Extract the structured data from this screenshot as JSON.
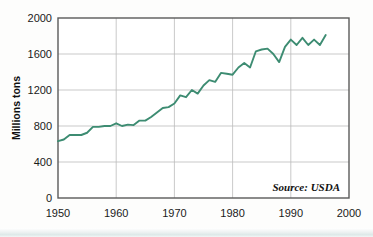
{
  "chart_data": {
    "type": "line",
    "title": "",
    "subtitle": "",
    "xlabel": "",
    "ylabel": "Millions tons",
    "xlim": [
      1950,
      2000
    ],
    "ylim": [
      0,
      2000
    ],
    "grid": true,
    "legend": null,
    "annotations": [
      {
        "name": "source",
        "text": "Source: USDA",
        "position": "bottom-right-inside"
      }
    ],
    "axis": {
      "y_ticks": [
        0,
        400,
        800,
        1200,
        1600,
        2000
      ],
      "y_tick_labels": [
        "0",
        "400",
        "800",
        "1200",
        "1600",
        "2000"
      ],
      "x_ticks": [
        1950,
        1960,
        1970,
        1980,
        1990,
        2000
      ],
      "x_tick_labels": [
        "1950",
        "1960",
        "1970",
        "1980",
        "1990",
        "2000"
      ]
    },
    "series": [
      {
        "name": "World grain production",
        "color": "#3d8c72",
        "x": [
          1950,
          1951,
          1952,
          1953,
          1954,
          1955,
          1956,
          1957,
          1958,
          1959,
          1960,
          1961,
          1962,
          1963,
          1964,
          1965,
          1966,
          1967,
          1968,
          1969,
          1970,
          1971,
          1972,
          1973,
          1974,
          1975,
          1976,
          1977,
          1978,
          1979,
          1980,
          1981,
          1982,
          1983,
          1984,
          1985,
          1986,
          1987,
          1988,
          1989,
          1990,
          1991,
          1992,
          1993,
          1994,
          1995,
          1996
        ],
        "values": [
          631,
          650,
          700,
          700,
          700,
          725,
          790,
          790,
          800,
          800,
          830,
          800,
          815,
          810,
          860,
          860,
          900,
          950,
          1000,
          1010,
          1050,
          1140,
          1120,
          1200,
          1160,
          1250,
          1310,
          1290,
          1390,
          1380,
          1370,
          1450,
          1500,
          1450,
          1630,
          1650,
          1660,
          1600,
          1510,
          1680,
          1760,
          1700,
          1780,
          1700,
          1760,
          1700,
          1810
        ]
      }
    ]
  },
  "figure": {
    "background_color": "#fdfdfc",
    "plot_border_color": "#5a5a5a",
    "gridline_color": "#bbbbbb",
    "line_color": "#3d8c72"
  }
}
